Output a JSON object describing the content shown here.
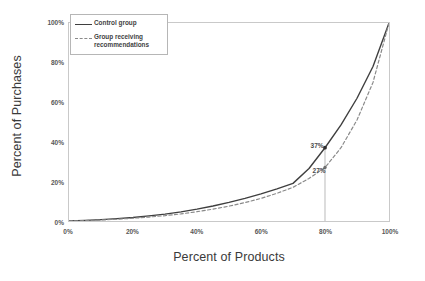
{
  "chart_data": {
    "type": "line",
    "title": "",
    "xlabel": "Percent of Products",
    "ylabel": "Percent of Purchases",
    "xlim": [
      0,
      100
    ],
    "ylim": [
      0,
      100
    ],
    "xticks": [
      "0%",
      "20%",
      "40%",
      "60%",
      "80%",
      "100%"
    ],
    "yticks": [
      "0%",
      "20%",
      "40%",
      "60%",
      "80%",
      "100%"
    ],
    "xtick_values": [
      0,
      20,
      40,
      60,
      80,
      100
    ],
    "ytick_values": [
      0,
      20,
      40,
      60,
      80,
      100
    ],
    "grid": false,
    "legend_position": "upper left (inside plot)",
    "series": [
      {
        "name": "Control group",
        "style": "solid",
        "color": "#3f3f3f",
        "x": [
          0,
          5,
          10,
          15,
          20,
          25,
          30,
          35,
          40,
          45,
          50,
          55,
          60,
          65,
          70,
          75,
          80,
          85,
          90,
          95,
          100
        ],
        "values": [
          0,
          0.3,
          0.7,
          1.2,
          1.8,
          2.6,
          3.5,
          4.6,
          6.0,
          7.6,
          9.4,
          11.4,
          13.7,
          16.2,
          19.0,
          26.5,
          37.0,
          48.5,
          62.0,
          78.0,
          100
        ]
      },
      {
        "name": "Group receiving recommendations",
        "style": "dashed",
        "color": "#8a8a8a",
        "x": [
          0,
          5,
          10,
          15,
          20,
          25,
          30,
          35,
          40,
          45,
          50,
          55,
          60,
          65,
          70,
          75,
          80,
          85,
          90,
          95,
          100
        ],
        "values": [
          0,
          0.2,
          0.5,
          0.9,
          1.4,
          2.0,
          2.7,
          3.6,
          4.7,
          6.0,
          7.5,
          9.3,
          11.4,
          14.0,
          17.0,
          21.5,
          27.0,
          37.0,
          51.0,
          70.0,
          100
        ]
      }
    ],
    "annotations": [
      {
        "label": "37%",
        "x": 80,
        "y": 37,
        "series": "Control group"
      },
      {
        "label": "27%",
        "x": 80,
        "y": 27,
        "series": "Group receiving recommendations"
      }
    ],
    "dropline": {
      "x": 80,
      "from_y": 37,
      "to_y": 0,
      "color": "#a8a8a8"
    }
  },
  "legend": {
    "items": [
      {
        "label": "Control group",
        "style": "solid"
      },
      {
        "label": "Group receiving recommendations",
        "style": "dashed"
      }
    ]
  },
  "axes": {
    "x_title": "Percent of Products",
    "y_title": "Percent of Purchases"
  }
}
